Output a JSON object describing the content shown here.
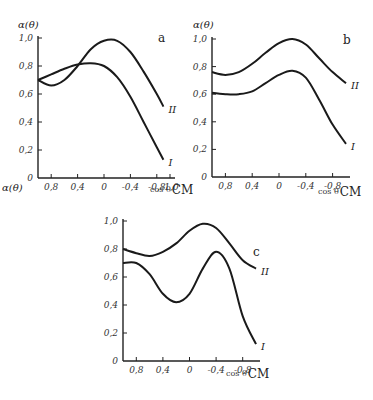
{
  "chart_data": [
    {
      "type": "line",
      "panel_label": "a",
      "ylabel": "α(θ)",
      "xlabel_prefix": "cos θ",
      "xlabel_suffix": "CM",
      "x_ticks": [
        0.8,
        0.4,
        0,
        -0.4,
        -0.8,
        -1.0
      ],
      "x_tick_labels": [
        "0,8",
        "0,4",
        "0",
        "-0,4",
        "-0,8",
        "-1,0"
      ],
      "y_ticks": [
        0,
        0.2,
        0.4,
        0.6,
        0.8,
        1.0
      ],
      "y_tick_labels": [
        "0",
        "0,2",
        "0,4",
        "0,6",
        "0,8",
        "1,0"
      ],
      "xlim": [
        1.0,
        -1.0
      ],
      "ylim": [
        0,
        1.0
      ],
      "grid": false,
      "series": [
        {
          "name": "I",
          "x": [
            1.0,
            0.8,
            0.6,
            0.4,
            0.2,
            0.0,
            -0.2,
            -0.4,
            -0.6,
            -0.8,
            -0.9
          ],
          "values": [
            0.7,
            0.74,
            0.78,
            0.81,
            0.82,
            0.8,
            0.72,
            0.58,
            0.4,
            0.22,
            0.13
          ]
        },
        {
          "name": "II",
          "x": [
            1.0,
            0.8,
            0.6,
            0.4,
            0.2,
            0.0,
            -0.2,
            -0.4,
            -0.6,
            -0.8,
            -0.9
          ],
          "values": [
            0.7,
            0.66,
            0.7,
            0.8,
            0.92,
            0.98,
            0.98,
            0.9,
            0.76,
            0.6,
            0.51
          ]
        }
      ]
    },
    {
      "type": "line",
      "panel_label": "b",
      "ylabel": "α(θ)",
      "xlabel_prefix": "cos θ",
      "xlabel_suffix": "CM",
      "x_ticks": [
        0.8,
        0.4,
        0,
        -0.4,
        -0.8
      ],
      "x_tick_labels": [
        "0,8",
        "0,4",
        "0",
        "-0,4",
        "-0,8"
      ],
      "y_ticks": [
        0,
        0.2,
        0.4,
        0.6,
        0.8,
        1.0
      ],
      "y_tick_labels": [
        "0",
        "0,2",
        "0,4",
        "0,6",
        "0,8",
        "1,0"
      ],
      "xlim": [
        1.0,
        -1.0
      ],
      "ylim": [
        0,
        1.0
      ],
      "grid": false,
      "series": [
        {
          "name": "I",
          "x": [
            1.0,
            0.8,
            0.6,
            0.4,
            0.2,
            0.0,
            -0.2,
            -0.4,
            -0.6,
            -0.8,
            -1.0
          ],
          "values": [
            0.61,
            0.6,
            0.6,
            0.62,
            0.68,
            0.74,
            0.77,
            0.72,
            0.56,
            0.38,
            0.24
          ]
        },
        {
          "name": "II",
          "x": [
            1.0,
            0.8,
            0.6,
            0.4,
            0.2,
            0.0,
            -0.2,
            -0.4,
            -0.6,
            -0.8,
            -1.0
          ],
          "values": [
            0.76,
            0.74,
            0.76,
            0.82,
            0.9,
            0.97,
            1.0,
            0.96,
            0.86,
            0.76,
            0.68
          ]
        }
      ]
    },
    {
      "type": "line",
      "panel_label": "c",
      "ylabel": "α(θ)",
      "xlabel_prefix": "cos θ",
      "xlabel_suffix": "CM",
      "x_ticks": [
        0.8,
        0.4,
        0,
        -0.4,
        -0.8
      ],
      "x_tick_labels": [
        "0,8",
        "0,4",
        "0",
        "-0,4",
        "-0,8"
      ],
      "y_ticks": [
        0,
        0.2,
        0.4,
        0.6,
        0.8,
        1.0
      ],
      "y_tick_labels": [
        "0",
        "0,2",
        "0,4",
        "0,6",
        "0,8",
        "1,0"
      ],
      "xlim": [
        1.0,
        -1.0
      ],
      "ylim": [
        0,
        1.0
      ],
      "grid": false,
      "series": [
        {
          "name": "I",
          "x": [
            1.0,
            0.8,
            0.6,
            0.4,
            0.2,
            0.0,
            -0.2,
            -0.4,
            -0.6,
            -0.8,
            -1.0
          ],
          "values": [
            0.7,
            0.7,
            0.62,
            0.48,
            0.42,
            0.48,
            0.66,
            0.78,
            0.66,
            0.32,
            0.12
          ]
        },
        {
          "name": "II",
          "x": [
            1.0,
            0.8,
            0.6,
            0.4,
            0.2,
            0.0,
            -0.2,
            -0.4,
            -0.6,
            -0.8,
            -1.0
          ],
          "values": [
            0.8,
            0.77,
            0.75,
            0.78,
            0.84,
            0.93,
            0.98,
            0.95,
            0.84,
            0.72,
            0.66
          ]
        }
      ]
    }
  ]
}
